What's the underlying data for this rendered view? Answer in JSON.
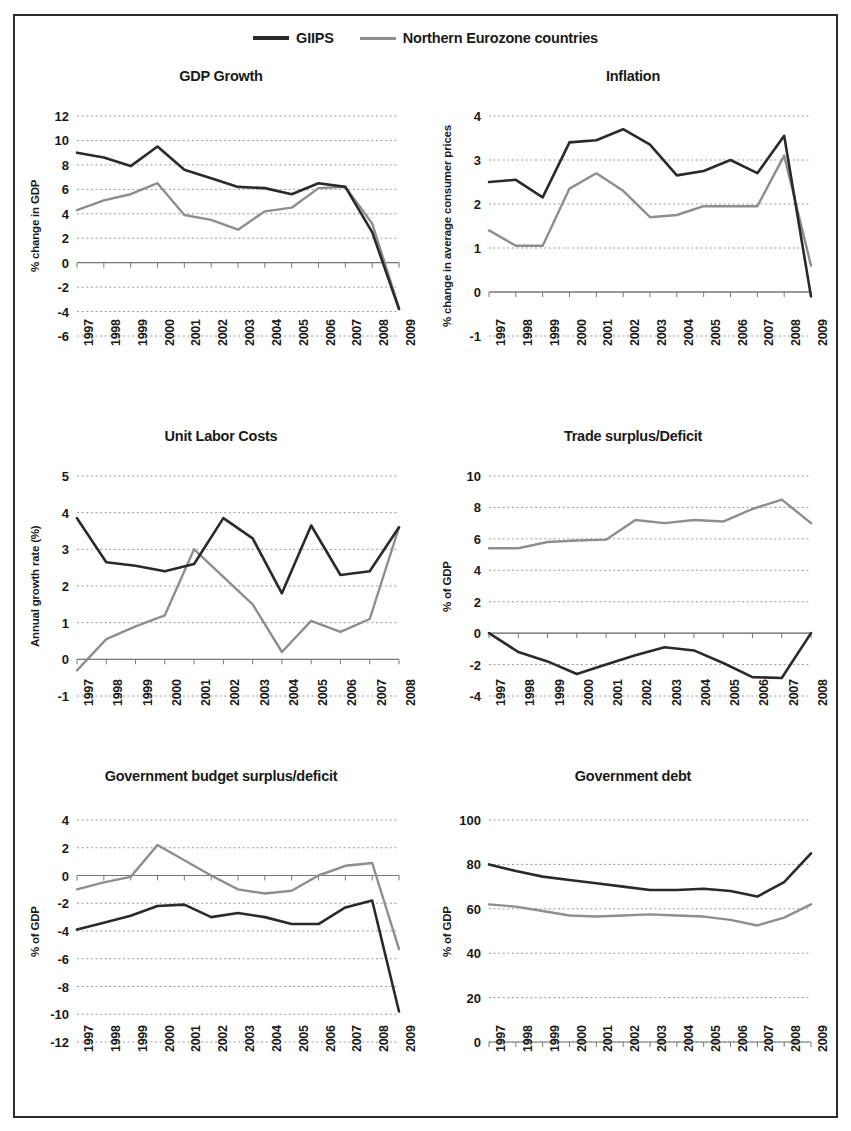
{
  "legend": {
    "entries": [
      {
        "label": "GIIPS",
        "color": "#2a2a2a",
        "style": "solid-dark"
      },
      {
        "label": "Northern Eurozone countries",
        "color": "#8e8e8e",
        "style": "solid-gray"
      }
    ]
  },
  "series_names": [
    "GIIPS",
    "Northern Eurozone countries"
  ],
  "chart_data": [
    {
      "type": "line",
      "id": "gdp-growth",
      "title": "GDP Growth",
      "xlabel": "",
      "ylabel": "% change in GDP",
      "categories": [
        "1997",
        "1998",
        "1999",
        "2000",
        "2001",
        "2002",
        "2003",
        "2004",
        "2005",
        "2006",
        "2007",
        "2008",
        "2009"
      ],
      "yticks": [
        12,
        10,
        8,
        6,
        4,
        2,
        0,
        -2,
        -4,
        -6
      ],
      "ylim": [
        -6,
        12
      ],
      "grid": true,
      "legend_position": "figure-top-center",
      "series": [
        {
          "name": "GIIPS",
          "color": "#2a2a2a",
          "values": [
            9.0,
            8.6,
            7.9,
            9.5,
            7.6,
            6.9,
            6.2,
            6.1,
            5.6,
            6.5,
            6.2,
            2.5,
            -3.8
          ]
        },
        {
          "name": "Northern Eurozone countries",
          "color": "#8e8e8e",
          "values": [
            4.3,
            5.1,
            5.6,
            6.5,
            3.9,
            3.5,
            2.7,
            4.2,
            4.5,
            6.1,
            6.2,
            3.2,
            -3.7
          ]
        }
      ]
    },
    {
      "type": "line",
      "id": "inflation",
      "title": "Inflation",
      "xlabel": "",
      "ylabel": "% change in average consumer prices",
      "categories": [
        "1997",
        "1998",
        "1999",
        "2000",
        "2001",
        "2002",
        "2003",
        "2004",
        "2005",
        "2006",
        "2007",
        "2008",
        "2009"
      ],
      "yticks": [
        4,
        3,
        2,
        1,
        0,
        -1
      ],
      "ylim": [
        -1,
        4
      ],
      "grid": true,
      "series": [
        {
          "name": "GIIPS",
          "color": "#2a2a2a",
          "values": [
            2.5,
            2.55,
            2.15,
            3.4,
            3.45,
            3.7,
            3.35,
            2.65,
            2.75,
            3.0,
            2.7,
            3.55,
            -0.1
          ]
        },
        {
          "name": "Northern Eurozone countries",
          "color": "#8e8e8e",
          "values": [
            1.4,
            1.05,
            1.05,
            2.35,
            2.7,
            2.3,
            1.7,
            1.75,
            1.95,
            1.95,
            1.95,
            3.1,
            0.6
          ]
        }
      ]
    },
    {
      "type": "line",
      "id": "unit-labor-costs",
      "title": "Unit Labor Costs",
      "xlabel": "",
      "ylabel": "Annual growth rate (%)",
      "categories": [
        "1997",
        "1998",
        "1999",
        "2000",
        "2001",
        "2002",
        "2003",
        "2004",
        "2005",
        "2006",
        "2007",
        "2008"
      ],
      "yticks": [
        5,
        4,
        3,
        2,
        1,
        0,
        -1
      ],
      "ylim": [
        -1,
        5
      ],
      "grid": true,
      "series": [
        {
          "name": "GIIPS",
          "color": "#2a2a2a",
          "values": [
            3.85,
            2.65,
            2.55,
            2.4,
            2.6,
            3.85,
            3.3,
            1.8,
            3.65,
            2.3,
            2.4,
            3.6
          ]
        },
        {
          "name": "Northern Eurozone countries",
          "color": "#8e8e8e",
          "values": [
            -0.3,
            0.55,
            0.9,
            1.2,
            3.0,
            2.25,
            1.5,
            0.2,
            1.05,
            0.75,
            1.1,
            3.6
          ]
        }
      ]
    },
    {
      "type": "line",
      "id": "trade-surplus-deficit",
      "title": "Trade surplus/Deficit",
      "xlabel": "",
      "ylabel": "% of GDP",
      "categories": [
        "1997",
        "1998",
        "1999",
        "2000",
        "2001",
        "2002",
        "2003",
        "2004",
        "2005",
        "2006",
        "2007",
        "2008"
      ],
      "yticks": [
        10,
        8,
        6,
        4,
        2,
        0,
        -2,
        -4
      ],
      "ylim": [
        -4,
        10
      ],
      "grid": true,
      "series": [
        {
          "name": "GIIPS",
          "color": "#2a2a2a",
          "values": [
            0.0,
            -1.2,
            -1.8,
            -2.6,
            -2.0,
            -1.4,
            -0.9,
            -1.1,
            -1.9,
            -2.8,
            -2.85,
            0.0
          ]
        },
        {
          "name": "Northern Eurozone countries",
          "color": "#8e8e8e",
          "values": [
            5.4,
            5.4,
            5.8,
            5.9,
            5.95,
            7.2,
            7.0,
            7.2,
            7.1,
            7.9,
            8.5,
            7.0
          ]
        }
      ]
    },
    {
      "type": "line",
      "id": "government-budget",
      "title": "Government budget surplus/deficit",
      "xlabel": "",
      "ylabel": "% of GDP",
      "categories": [
        "1997",
        "1998",
        "1999",
        "2000",
        "2001",
        "2002",
        "2003",
        "2004",
        "2005",
        "2006",
        "2007",
        "2008",
        "2009"
      ],
      "yticks": [
        4,
        2,
        0,
        -2,
        -4,
        -6,
        -8,
        -10,
        -12
      ],
      "ylim": [
        -12,
        4
      ],
      "grid": true,
      "series": [
        {
          "name": "GIIPS",
          "color": "#2a2a2a",
          "values": [
            -3.9,
            -3.4,
            -2.9,
            -2.2,
            -2.1,
            -3.0,
            -2.7,
            -3.0,
            -3.5,
            -3.5,
            -2.3,
            -1.8,
            -9.8
          ]
        },
        {
          "name": "Northern Eurozone countries",
          "color": "#8e8e8e",
          "values": [
            -1.0,
            -0.5,
            -0.1,
            2.2,
            1.1,
            0.0,
            -1.0,
            -1.3,
            -1.1,
            0.0,
            0.7,
            0.9,
            -5.3
          ]
        }
      ]
    },
    {
      "type": "line",
      "id": "government-debt",
      "title": "Government debt",
      "xlabel": "",
      "ylabel": "% of GDP",
      "categories": [
        "1997",
        "1998",
        "1999",
        "2000",
        "2001",
        "2002",
        "2003",
        "2004",
        "2005",
        "2006",
        "2007",
        "2008",
        "2009"
      ],
      "yticks": [
        100,
        80,
        60,
        40,
        20,
        0
      ],
      "ylim": [
        0,
        100
      ],
      "grid": true,
      "series": [
        {
          "name": "GIIPS",
          "color": "#2a2a2a",
          "values": [
            80.0,
            77.0,
            74.5,
            73.0,
            71.5,
            70.0,
            68.5,
            68.5,
            69.0,
            68.0,
            65.5,
            72.0,
            85.0
          ]
        },
        {
          "name": "Northern Eurozone countries",
          "color": "#8e8e8e",
          "values": [
            62.0,
            61.0,
            59.0,
            57.0,
            56.5,
            57.0,
            57.5,
            57.0,
            56.5,
            55.0,
            52.5,
            56.0,
            62.0
          ]
        }
      ]
    }
  ]
}
